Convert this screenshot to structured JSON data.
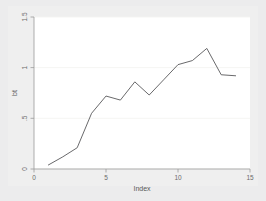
{
  "figure": {
    "background_color": "#ececed",
    "panel_color": "#efefef",
    "plot_background_color": "#ffffff",
    "line_color": "#58585a",
    "axis_color": "#9a9a9a",
    "grid_color": "#f4f4f2"
  },
  "chart_data": {
    "type": "line",
    "title": "",
    "subtitle": "",
    "xlabel": "Index",
    "ylabel": "bt",
    "xlim": [
      0,
      15
    ],
    "ylim": [
      0,
      1.5
    ],
    "xticks": [
      0,
      5,
      10,
      15
    ],
    "xtick_labels": [
      "0",
      "5",
      "10",
      "15"
    ],
    "yticks": [
      0,
      0.5,
      1,
      1.5
    ],
    "ytick_labels": [
      "0",
      ".5",
      "1",
      "1.5"
    ],
    "grid": true,
    "grid_axis": "y",
    "legend": false,
    "legend_position": "none",
    "x": [
      1,
      2,
      3,
      4,
      5,
      6,
      7,
      8,
      9,
      10,
      11,
      12,
      13,
      14
    ],
    "y": [
      0.04,
      0.12,
      0.21,
      0.55,
      0.72,
      0.68,
      0.86,
      0.73,
      0.88,
      1.03,
      1.07,
      1.19,
      0.93,
      0.92
    ],
    "series": [
      {
        "name": "bt",
        "values": [
          0.04,
          0.12,
          0.21,
          0.55,
          0.72,
          0.68,
          0.86,
          0.73,
          0.88,
          1.03,
          1.07,
          1.19,
          0.93,
          0.92
        ]
      }
    ],
    "annotations": []
  }
}
